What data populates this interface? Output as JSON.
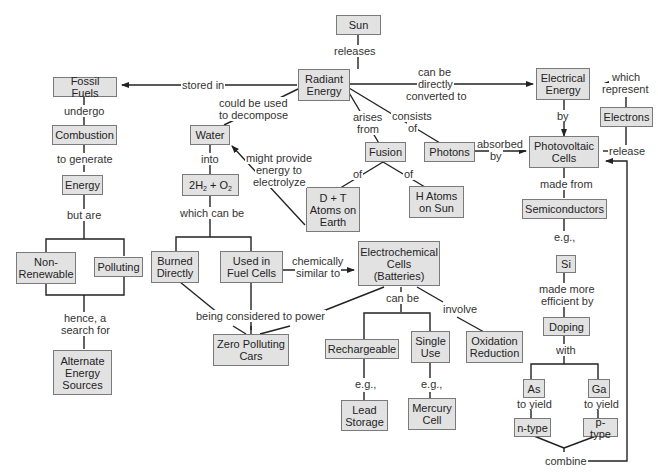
{
  "diagram": {
    "type": "concept-map",
    "colors": {
      "node_fill": "#e2e2e2",
      "node_border": "#7a7a7a",
      "line": "#222222",
      "background": "#ffffff"
    },
    "nodes": {
      "sun": "Sun",
      "radiant_energy": "Radiant Energy",
      "fossil_fuels": "Fossil Fuels",
      "combustion": "Combustion",
      "energy": "Energy",
      "non_renewable": "Non-Renewable",
      "polluting": "Polluting",
      "alternate_energy_sources": "Alternate Energy Sources",
      "water": "Water",
      "h2_o2": "2H2 + O2",
      "burned_directly": "Burned Directly",
      "used_in_fuel_cells": "Used in Fuel Cells",
      "zero_polluting_cars": "Zero Polluting Cars",
      "fusion": "Fusion",
      "dt_atoms": "D + T Atoms on Earth",
      "h_atoms": "H Atoms on Sun",
      "photons": "Photons",
      "electrochemical_cells": "Electrochemical Cells (Batteries)",
      "rechargeable": "Rechargeable",
      "single_use": "Single Use",
      "oxidation_reduction": "Oxidation Reduction",
      "lead_storage": "Lead Storage",
      "mercury_cell": "Mercury Cell",
      "electrical_energy": "Electrical Energy",
      "electrons": "Electrons",
      "photovoltaic_cells": "Photovoltaic Cells",
      "semiconductors": "Semiconductors",
      "si": "Si",
      "doping": "Doping",
      "as": "As",
      "ga": "Ga",
      "n_type": "n-type",
      "p_type": "p-type"
    },
    "links": {
      "releases": "releases",
      "stored_in": "stored in",
      "could_be_used": "could be used",
      "to_decompose": "to decompose",
      "can_be_directly_1": "can be",
      "can_be_directly_2": "directly",
      "can_be_directly_3": "converted to",
      "arises_1": "arises",
      "arises_2": "from",
      "consists_1": "consists",
      "consists_2": "of",
      "undergo": "undergo",
      "to_generate": "to generate",
      "but_are": "but are",
      "hence_1": "hence, a",
      "hence_2": "search for",
      "into": "into",
      "might_1": "might provide",
      "might_2": "energy to",
      "might_3": "electrolyze",
      "which_can_be": "which can be",
      "fusion_of_left": "of",
      "fusion_of_right": "of",
      "absorbed_1": "absorbed",
      "absorbed_2": "by",
      "by": "by",
      "which_1": "which",
      "which_2": "represent",
      "release": "release",
      "chemically_1": "chemically",
      "chemically_2": "similar to",
      "being_considered": "being considered to power",
      "can_be": "can be",
      "involve": "involve",
      "eg_left": "e.g.,",
      "eg_mid": "e.g.,",
      "made_from": "made from",
      "eg_si": "e.g.,",
      "made_more_1": "made more",
      "made_more_2": "efficient by",
      "with": "with",
      "to_yield_left": "to yield",
      "to_yield_right": "to yield",
      "combine": "combine"
    }
  }
}
